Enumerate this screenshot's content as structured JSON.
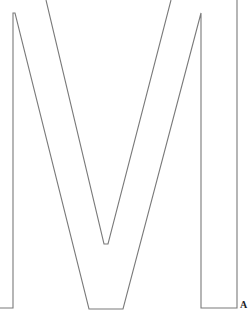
{
  "figure": {
    "glyph_letter": "M",
    "corner_label": "A",
    "stroke_color": "#7a7a7a",
    "background_color": "#ffffff"
  }
}
